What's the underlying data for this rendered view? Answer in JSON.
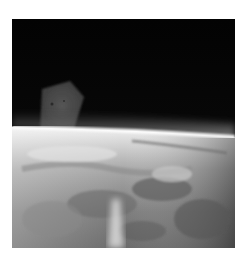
{
  "image": {
    "alt": "Grayscale photograph of Earth's curved horizon seen from orbit, with cloud-covered surface below a black sky and a faint pentagon-shaped object floating in the upper left",
    "frame": {
      "x": 12,
      "y": 19,
      "width": 223,
      "height": 229
    },
    "colors": {
      "background": "#ffffff",
      "sky": "#050505",
      "object": "#4a4a4a",
      "atmosphere_glow": "#e8e8e8",
      "surface_light": "#d0d0d0",
      "surface_mid": "#8c8c8c",
      "surface_dark": "#4d4d4d"
    },
    "object": {
      "shape": "pentagon",
      "points": "30,70 58,62 72,78 62,110 28,112"
    },
    "horizon": {
      "left_y": 108,
      "right_y": 118
    }
  }
}
